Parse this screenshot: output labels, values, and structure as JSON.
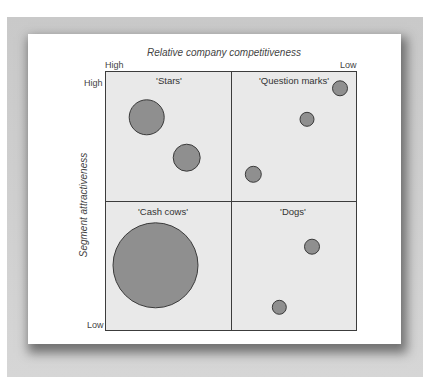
{
  "chart_data": {
    "type": "scatter",
    "subtype": "bubble-matrix",
    "title": "Relative company competitiveness",
    "xlabel": "Relative company competitiveness",
    "ylabel": "Segment attractiveness",
    "x_axis": {
      "left": "High",
      "right": "Low"
    },
    "y_axis": {
      "top": "High",
      "bottom": "Low"
    },
    "grid": false,
    "quadrants": [
      {
        "name": "'Stars'",
        "position": "top-left"
      },
      {
        "name": "'Question marks'",
        "position": "top-right"
      },
      {
        "name": "'Cash cows'",
        "position": "bottom-left"
      },
      {
        "name": "'Dogs'",
        "position": "bottom-right"
      }
    ],
    "points": [
      {
        "quadrant": "'Stars'",
        "cx": 146.7,
        "cy": 117.3,
        "r": 17.5
      },
      {
        "quadrant": "'Stars'",
        "cx": 186.7,
        "cy": 157.7,
        "r": 13.5
      },
      {
        "quadrant": "'Question marks'",
        "cx": 340,
        "cy": 88.3,
        "r": 7.5
      },
      {
        "quadrant": "'Question marks'",
        "cx": 307,
        "cy": 119.3,
        "r": 7
      },
      {
        "quadrant": "'Question marks'",
        "cx": 253.3,
        "cy": 174.3,
        "r": 8
      },
      {
        "quadrant": "'Cash cows'",
        "cx": 155.5,
        "cy": 265.3,
        "r": 42.5
      },
      {
        "quadrant": "'Dogs'",
        "cx": 312,
        "cy": 246.7,
        "r": 7.5
      },
      {
        "quadrant": "'Dogs'",
        "cx": 279.3,
        "cy": 307.3,
        "r": 7
      }
    ]
  },
  "labels": {
    "title": "Relative company competitiveness",
    "y_title": "Segment attractiveness",
    "x_high": "High",
    "x_low": "Low",
    "y_high": "High",
    "y_low": "Low",
    "quadrants": {
      "stars": "'Stars'",
      "question_marks": "'Question marks'",
      "cash_cows": "'Cash cows'",
      "dogs": "'Dogs'"
    }
  },
  "colors": {
    "bubble_fill": "#8f8f8f",
    "bubble_stroke": "#3a3a3a",
    "quadrant_bg": "#e9e9e9",
    "frame": "#cccccc"
  }
}
